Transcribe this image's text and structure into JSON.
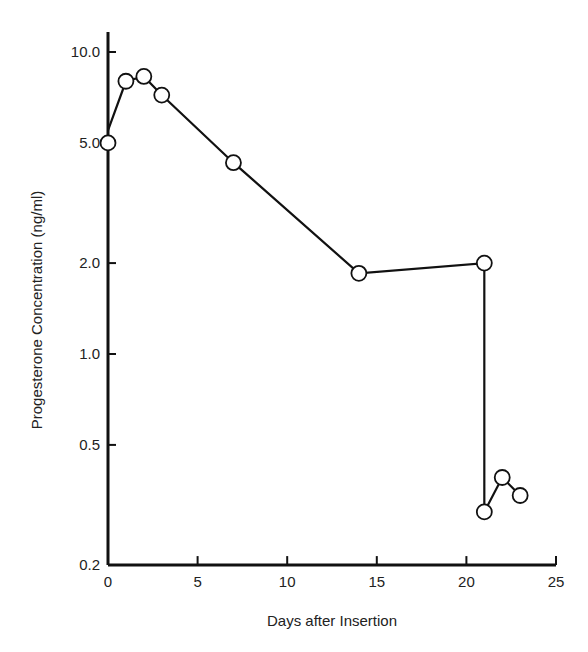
{
  "chart_data": {
    "type": "line",
    "title": "",
    "xlabel": "Days after Insertion",
    "ylabel": "Progesterone Concentration (ng/ml)",
    "xlim": [
      0,
      25
    ],
    "ylim": [
      0.2,
      10.0
    ],
    "yscale": "log",
    "grid": false,
    "legend": null,
    "x_ticks": [
      0,
      5,
      10,
      15,
      20,
      25
    ],
    "x_tick_labels": [
      "0",
      "5",
      "10",
      "15",
      "20",
      "25"
    ],
    "y_ticks": [
      0.2,
      0.5,
      1.0,
      2.0,
      5.0,
      10.0
    ],
    "y_tick_labels": [
      "0.2",
      "0.5",
      "1.0",
      "2.0",
      "5.0",
      "10.0"
    ],
    "series": [
      {
        "name": "Progesterone",
        "marker": "open-circle",
        "x": [
          0,
          1,
          2,
          3,
          7,
          14,
          21,
          21,
          22,
          23
        ],
        "values": [
          5.0,
          8.0,
          8.3,
          7.2,
          4.3,
          1.85,
          2.0,
          0.3,
          0.39,
          0.34
        ]
      }
    ],
    "annotations": [
      "Line at day 0 starts at ~5.5 ng/ml above the plotted 5.0 marker"
    ]
  }
}
